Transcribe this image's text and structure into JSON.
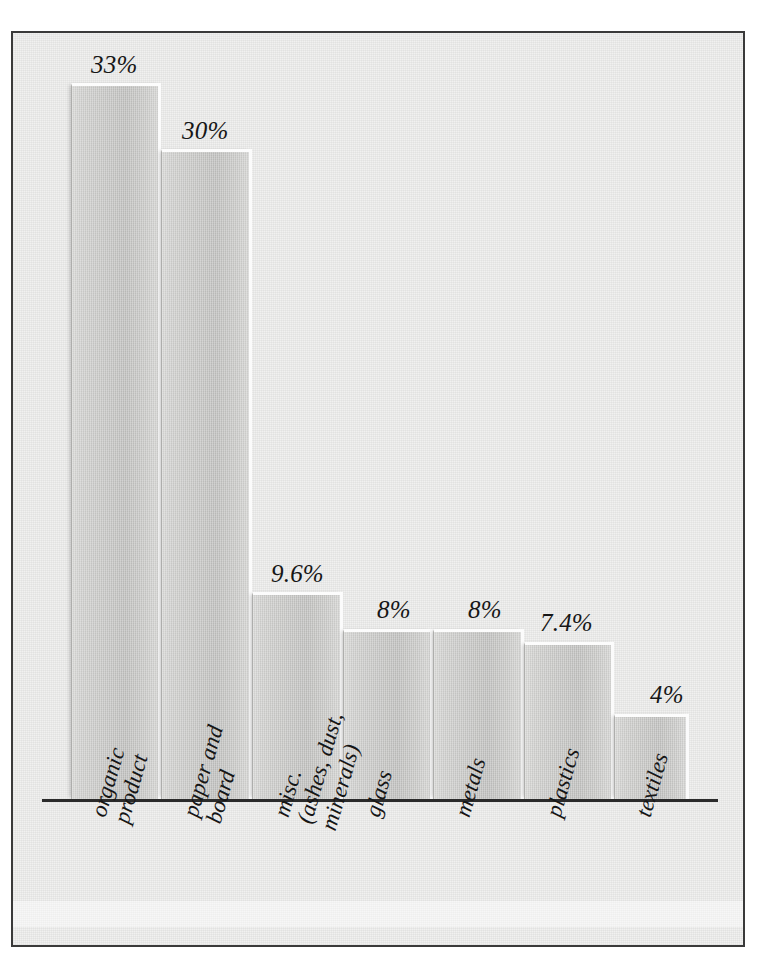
{
  "figure": {
    "frame_color": "#3a3a3a",
    "background_color": "#efefee",
    "bar_color": "#c6c6c4",
    "label_color": "#161616"
  },
  "chart_data": {
    "type": "bar",
    "title": "",
    "subtitle": "",
    "xlabel": "",
    "ylabel": "",
    "grid": false,
    "legend": false,
    "axis": "single horizontal baseline, no y-axis, no tick marks",
    "ylim": [
      0,
      36
    ],
    "categories": [
      "organic product",
      "paper and board",
      "misc. (ashes, dust, minerals)",
      "glass",
      "metals",
      "plastics",
      "textiles"
    ],
    "category_lines": [
      [
        "organic",
        "product"
      ],
      [
        "paper and",
        "board"
      ],
      [
        "misc.",
        "(ashes, dust,",
        "minerals)"
      ],
      [
        "glass"
      ],
      [
        "metals"
      ],
      [
        "plastics"
      ],
      [
        "textiles"
      ]
    ],
    "values": [
      33,
      30,
      9.6,
      8,
      8,
      7.4,
      4
    ],
    "value_labels": [
      "33%",
      "30%",
      "9.6%",
      "8%",
      "8%",
      "7.4%",
      "4%"
    ],
    "units": "percent"
  },
  "bars": [
    {
      "name": "organic product",
      "label": "33%",
      "value": 33,
      "left": 58,
      "top": 50,
      "width": 90,
      "height": 716,
      "label_x": 78,
      "label_y": 18
    },
    {
      "name": "paper and board",
      "label": "30%",
      "value": 30,
      "left": 148,
      "top": 116,
      "width": 91,
      "height": 650,
      "label_x": 169,
      "label_y": 84
    },
    {
      "name": "misc. (ashes, dust, minerals)",
      "label": "9.6%",
      "value": 9.6,
      "left": 239,
      "top": 559,
      "width": 91,
      "height": 207,
      "label_x": 258,
      "label_y": 527
    },
    {
      "name": "glass",
      "label": "8%",
      "value": 8,
      "left": 330,
      "top": 596,
      "width": 90,
      "height": 170,
      "label_x": 364,
      "label_y": 563
    },
    {
      "name": "metals",
      "label": "8%",
      "value": 8,
      "left": 420,
      "top": 596,
      "width": 91,
      "height": 170,
      "label_x": 455,
      "label_y": 563
    },
    {
      "name": "plastics",
      "label": "7.4%",
      "value": 7.4,
      "left": 511,
      "top": 609,
      "width": 90,
      "height": 157,
      "label_x": 527,
      "label_y": 576
    },
    {
      "name": "textiles",
      "label": "4%",
      "value": 4,
      "left": 601,
      "top": 681,
      "width": 75,
      "height": 85,
      "label_x": 637,
      "label_y": 648
    }
  ],
  "category_labels": [
    {
      "name": "organic product",
      "x": 74,
      "y": 780
    },
    {
      "name": "paper and board",
      "x": 166,
      "y": 780
    },
    {
      "name": "misc. (ashes, dust, minerals)",
      "x": 257,
      "y": 780
    },
    {
      "name": "glass",
      "x": 348,
      "y": 780
    },
    {
      "name": "metals",
      "x": 438,
      "y": 780
    },
    {
      "name": "plastics",
      "x": 529,
      "y": 780
    },
    {
      "name": "textiles",
      "x": 619,
      "y": 780
    }
  ]
}
